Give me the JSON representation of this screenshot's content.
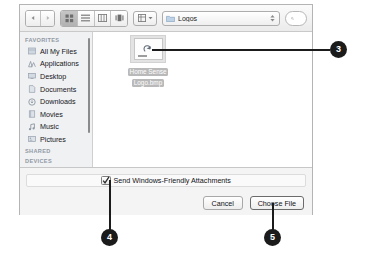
{
  "dialog": {
    "toolbar": {
      "nav_back": "back-arrow",
      "nav_forward": "forward-arrow",
      "view_buttons": [
        {
          "name": "icon-view",
          "selected": true
        },
        {
          "name": "list-view",
          "selected": false
        },
        {
          "name": "column-view",
          "selected": false
        },
        {
          "name": "coverflow-view",
          "selected": false
        }
      ],
      "arrange_button": "arrange-by",
      "path": "Logos",
      "search_placeholder": ""
    },
    "sidebar": {
      "groups": [
        {
          "header": "FAVORITES",
          "items": [
            {
              "label": "All My Files",
              "icon": "all-my-files-icon"
            },
            {
              "label": "Applications",
              "icon": "applications-icon"
            },
            {
              "label": "Desktop",
              "icon": "desktop-icon"
            },
            {
              "label": "Documents",
              "icon": "documents-icon"
            },
            {
              "label": "Downloads",
              "icon": "downloads-icon"
            },
            {
              "label": "Movies",
              "icon": "movies-icon"
            },
            {
              "label": "Music",
              "icon": "music-icon"
            },
            {
              "label": "Pictures",
              "icon": "pictures-icon"
            }
          ]
        },
        {
          "header": "SHARED",
          "items": []
        },
        {
          "header": "DEVICES",
          "items": []
        }
      ]
    },
    "files": [
      {
        "name_line1": "Home Sense",
        "name_line2": "Logo.bmp",
        "selected": true,
        "icon": "bitmap-image-icon"
      }
    ],
    "options": {
      "checkbox_label": "Send Windows-Friendly Attachments",
      "checkbox_checked": true
    },
    "buttons": {
      "cancel": "Cancel",
      "choose": "Choose File"
    }
  },
  "callouts": [
    {
      "number": "3"
    },
    {
      "number": "4"
    },
    {
      "number": "5"
    }
  ],
  "colors": {
    "callout": "#1b1b1b",
    "sidebar_bg": "#f0f1f3",
    "selection": "#b9b9b9"
  }
}
